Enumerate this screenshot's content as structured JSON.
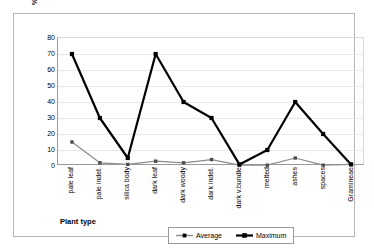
{
  "chart_data": {
    "type": "line",
    "title": "",
    "xlabel": "Plant type",
    "ylabel": "% of deposit area",
    "ylim": [
      0,
      80
    ],
    "ytick_step": 10,
    "yticks": [
      80,
      70,
      60,
      50,
      40,
      30,
      20,
      10,
      0
    ],
    "grid": true,
    "legend_position": "bottom-center",
    "categories": [
      "pale leaf",
      "pale indet.",
      "silica body",
      "dark leaf",
      "dark woody",
      "dark indet.",
      "dark v.bundle",
      "melted",
      "ashes",
      "spaces",
      "Gramineae"
    ],
    "series": [
      {
        "name": "Average",
        "color": "#8c8c8c",
        "marker": "square",
        "line_width": 1.2,
        "values": [
          15,
          2,
          1,
          3,
          2,
          4,
          0.5,
          0.5,
          5,
          0.5,
          1
        ]
      },
      {
        "name": "Maximum",
        "color": "#000000",
        "marker": "square",
        "line_width": 2.2,
        "values": [
          70,
          30,
          5,
          70,
          40,
          30,
          1,
          10,
          40,
          20,
          1
        ]
      }
    ]
  },
  "figure": {
    "border_color": "#b5b5b5",
    "background": "#ffffff",
    "gridline_color": "#e8e8e8",
    "axis_color": "#9a9a9a"
  }
}
